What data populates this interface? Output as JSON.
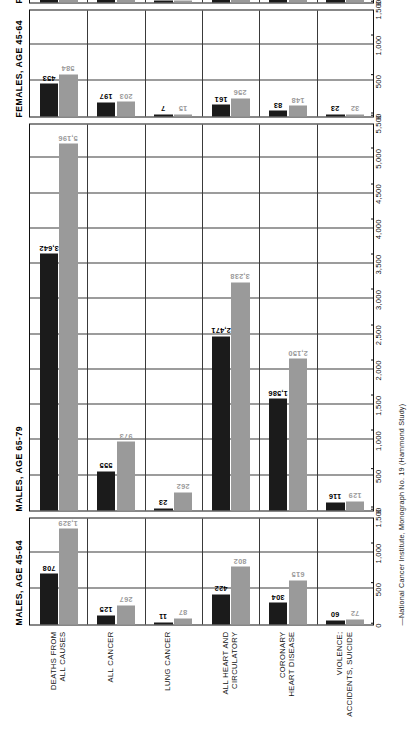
{
  "chart_data": {
    "type": "bar",
    "xlabel": "",
    "ylabel": "",
    "xlim": [
      0,
      5500
    ],
    "grid": true,
    "legend_position": "right",
    "tick_labels": [
      "0",
      "500",
      "1,000",
      "1,500",
      "2,000",
      "2,500",
      "3,000",
      "3,500",
      "4,000",
      "4,500",
      "5,000",
      "5,500"
    ],
    "tick_values": [
      0,
      500,
      1000,
      1500,
      2000,
      2500,
      3000,
      3500,
      4000,
      4500,
      5000,
      5500
    ],
    "categories": [
      "DEATHS FROM\nALL CAUSES",
      "ALL CANCER",
      "LUNG CANCER",
      "ALL HEART AND\nCIRCULATORY",
      "CORONARY\nHEART DISEASE",
      "VIOLENCE;\nACCIDENTS, SUICIDE"
    ],
    "legend": [
      {
        "name": "NEVER SMOKED REGULARLY",
        "color": "#1b1b1b"
      },
      {
        "name": "SMOKER",
        "color": "#9a9a9a"
      }
    ],
    "panels": [
      {
        "title": "MALES, AGE 45-64",
        "xlim": [
          0,
          1500
        ],
        "tick_labels": [
          "0",
          "500",
          "1,000",
          "1,500"
        ],
        "tick_values": [
          0,
          500,
          1000,
          1500
        ],
        "series": [
          {
            "name": "NEVER SMOKED REGULARLY",
            "color": "#1b1b1b",
            "values": [
              708,
              125,
              11,
              422,
              304,
              60
            ]
          },
          {
            "name": "SMOKER",
            "color": "#9a9a9a",
            "values": [
              1329,
              267,
              87,
              802,
              615,
              72
            ]
          }
        ]
      },
      {
        "title": "MALES, AGE 65-79",
        "xlim": [
          0,
          5500
        ],
        "tick_labels": [
          "0",
          "500",
          "1,000",
          "1,500",
          "2,000",
          "2,500",
          "3,000",
          "3,500",
          "4,000",
          "4,500",
          "5,000",
          "5,500"
        ],
        "tick_values": [
          0,
          500,
          1000,
          1500,
          2000,
          2500,
          3000,
          3500,
          4000,
          4500,
          5000,
          5500
        ],
        "series": [
          {
            "name": "NEVER SMOKED REGULARLY",
            "color": "#1b1b1b",
            "values": [
              3642,
              555,
              23,
              2471,
              1586,
              116
            ]
          },
          {
            "name": "SMOKER",
            "color": "#9a9a9a",
            "values": [
              5196,
              973,
              262,
              3238,
              2150,
              129
            ]
          }
        ]
      },
      {
        "title": "FEMALES, AGE 45-64",
        "xlim": [
          0,
          1500
        ],
        "tick_labels": [
          "0",
          "500",
          "1,000",
          "1,500"
        ],
        "tick_values": [
          0,
          500,
          1000,
          1500
        ],
        "series": [
          {
            "name": "NEVER SMOKED REGULARLY",
            "color": "#1b1b1b",
            "values": [
              453,
              197,
              7,
              161,
              83,
              23
            ]
          },
          {
            "name": "SMOKER",
            "color": "#9a9a9a",
            "values": [
              584,
              203,
              15,
              256,
              148,
              32
            ]
          }
        ]
      },
      {
        "title": "FEMALES, AGE 65-79",
        "xlim": [
          0,
          5500
        ],
        "tick_labels": [
          "0",
          "500",
          "1,000",
          "1,500",
          "2,000",
          "2,500",
          "3,000",
          "3,500",
          "4,000",
          "4,500",
          "5,000",
          "5,500"
        ],
        "tick_values": [
          0,
          500,
          1000,
          1500,
          2000,
          2500,
          3000,
          3500,
          4000,
          4500,
          5000,
          5500
        ],
        "series": [
          {
            "name": "NEVER SMOKED REGULARLY",
            "color": "#1b1b1b",
            "values": [
              2331,
              518,
              17,
              1434,
              903,
              51
            ]
          },
          {
            "name": "SMOKER",
            "color": "#9a9a9a",
            "values": [
              2867,
              572,
              30,
              1831,
              1029,
              64
            ]
          }
        ]
      }
    ],
    "source": "—National Cancer Institute, Monograph No. 19 (Hammond Study)"
  }
}
